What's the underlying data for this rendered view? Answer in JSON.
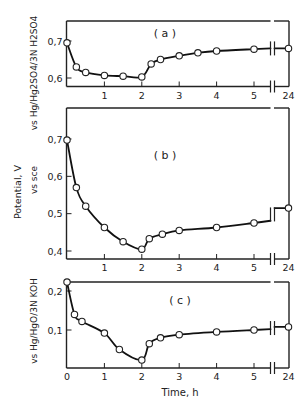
{
  "figure": {
    "shared_ylabel": "Potential, V",
    "xlabel": "Time,  h"
  },
  "chart_data": [
    {
      "type": "line",
      "panel": "(a)",
      "title": "(a)",
      "ylabel": "vs Hg/Hg2SO4/3N H2SO4",
      "xlabel": "Time, h",
      "x_ticks": [
        "1",
        "2",
        "3",
        "4",
        "5",
        "24"
      ],
      "y_ticks": [
        "0.7",
        "0.6"
      ],
      "ylim": [
        0.58,
        0.755
      ],
      "axis_break": "between 5 and 24 h",
      "grid": false,
      "series": [
        {
          "name": "Hg/Hg2SO4 reference",
          "x": [
            0,
            0.25,
            0.5,
            1,
            1.5,
            2,
            2.25,
            2.5,
            3,
            3.5,
            4,
            5,
            24
          ],
          "y": [
            0.695,
            0.63,
            0.615,
            0.607,
            0.605,
            0.603,
            0.638,
            0.65,
            0.66,
            0.668,
            0.673,
            0.678,
            0.68
          ]
        }
      ]
    },
    {
      "type": "line",
      "panel": "(b)",
      "title": "(b)",
      "ylabel": "vs sce",
      "xlabel": "Time, h",
      "x_ticks": [
        "1",
        "2",
        "3",
        "4",
        "5",
        "24"
      ],
      "y_ticks": [
        "0.7",
        "0.6",
        "0.5",
        "0.4"
      ],
      "ylim": [
        0.38,
        0.78
      ],
      "axis_break": "between 5 and 24 h",
      "grid": false,
      "series": [
        {
          "name": "SCE reference",
          "x": [
            0,
            0.25,
            0.5,
            1,
            1.5,
            2,
            2.2,
            2.55,
            3,
            4,
            5,
            24
          ],
          "y": [
            0.697,
            0.57,
            0.52,
            0.463,
            0.425,
            0.405,
            0.433,
            0.445,
            0.455,
            0.463,
            0.475,
            0.515
          ]
        }
      ]
    },
    {
      "type": "line",
      "panel": "(c)",
      "title": "(c)",
      "ylabel": "vs Hg/HgO/3N KOH",
      "xlabel": "Time,  h",
      "x_ticks": [
        "0",
        "1",
        "2",
        "3",
        "4",
        "5",
        "24"
      ],
      "y_ticks": [
        "0.2",
        "0.1"
      ],
      "ylim": [
        0.0,
        0.225
      ],
      "axis_break": "between 5 and 24 h",
      "grid": false,
      "series": [
        {
          "name": "Hg/HgO reference",
          "x": [
            0,
            0.2,
            0.4,
            1,
            1.4,
            2,
            2.2,
            2.5,
            3,
            4,
            5,
            24
          ],
          "y": [
            0.223,
            0.14,
            0.122,
            0.092,
            0.05,
            0.023,
            0.065,
            0.08,
            0.088,
            0.095,
            0.1,
            0.108
          ]
        }
      ]
    }
  ]
}
